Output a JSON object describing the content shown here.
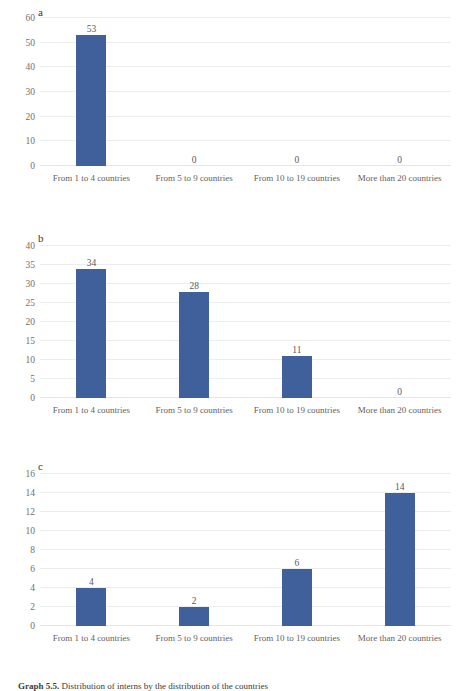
{
  "figure": {
    "caption_label": "Graph 5.5.",
    "caption_text": "Distribution of interns by the distribution of the countries"
  },
  "chart_data": [
    {
      "type": "bar",
      "panel": "a",
      "title": "",
      "xlabel": "",
      "ylabel": "",
      "categories": [
        "From 1 to 4 countries",
        "From 5 to 9 countries",
        "From 10 to 19 countries",
        "More than 20 countries"
      ],
      "values": [
        53,
        0,
        0,
        0
      ],
      "yticks": [
        0,
        10,
        20,
        30,
        40,
        50,
        60
      ],
      "ylim": [
        0,
        60
      ],
      "grid": true,
      "legend": "none",
      "bar_color": "#40609c"
    },
    {
      "type": "bar",
      "panel": "b",
      "title": "",
      "xlabel": "",
      "ylabel": "",
      "categories": [
        "From 1 to 4 countries",
        "From 5 to 9 countries",
        "From 10 to 19 countries",
        "More than 20 countries"
      ],
      "values": [
        34,
        28,
        11,
        0
      ],
      "yticks": [
        0,
        5,
        10,
        15,
        20,
        25,
        30,
        35,
        40
      ],
      "ylim": [
        0,
        40
      ],
      "grid": true,
      "legend": "none",
      "bar_color": "#40609c"
    },
    {
      "type": "bar",
      "panel": "c",
      "title": "",
      "xlabel": "",
      "ylabel": "",
      "categories": [
        "From 1 to 4 countries",
        "From 5 to 9 countries",
        "From 10 to 19 countries",
        "More than 20 countries"
      ],
      "values": [
        4,
        2,
        6,
        14
      ],
      "yticks": [
        0,
        2,
        4,
        6,
        8,
        10,
        12,
        14,
        16
      ],
      "ylim": [
        0,
        16
      ],
      "grid": true,
      "legend": "none",
      "bar_color": "#40609c"
    }
  ]
}
